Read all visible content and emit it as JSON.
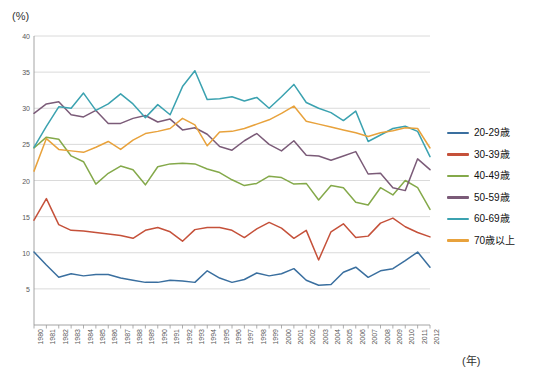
{
  "chart_data": {
    "type": "line",
    "title": "",
    "xlabel": "(年)",
    "ylabel": "(%)",
    "ylim": [
      0,
      40
    ],
    "yticks": [
      5,
      10,
      15,
      20,
      25,
      30,
      35,
      40
    ],
    "grid": true,
    "legend_position": "right",
    "categories": [
      "1980",
      "1981",
      "1982",
      "1983",
      "1984",
      "1985",
      "1986",
      "1987",
      "1988",
      "1989",
      "1990",
      "1991",
      "1992",
      "1993",
      "1994",
      "1995",
      "1996",
      "1997",
      "1998",
      "1999",
      "2000",
      "2001",
      "2002",
      "2003",
      "2004",
      "2005",
      "2006",
      "2007",
      "2008",
      "2009",
      "2010",
      "2011",
      "2012"
    ],
    "series": [
      {
        "name": "20-29歳",
        "color": "#3a6f9f",
        "values": [
          10.1,
          8.3,
          6.6,
          7.1,
          6.8,
          7.0,
          7.0,
          6.5,
          6.2,
          5.9,
          5.9,
          6.2,
          6.1,
          5.9,
          7.5,
          6.5,
          5.9,
          6.3,
          7.2,
          6.8,
          7.1,
          7.8,
          6.2,
          5.5,
          5.6,
          7.3,
          8.0,
          6.6,
          7.5,
          7.8,
          8.9,
          10.1,
          8.0
        ]
      },
      {
        "name": "30-39歳",
        "color": "#c5513a",
        "values": [
          14.5,
          17.5,
          13.9,
          13.1,
          13.0,
          12.8,
          12.6,
          12.4,
          12.0,
          13.1,
          13.5,
          12.9,
          11.6,
          13.2,
          13.5,
          13.5,
          13.1,
          12.1,
          13.3,
          14.2,
          13.4,
          12.0,
          13.1,
          9.0,
          12.9,
          14.0,
          12.1,
          12.3,
          14.1,
          14.8,
          13.6,
          12.8,
          12.2
        ]
      },
      {
        "name": "40-49歳",
        "color": "#84a94a",
        "values": [
          24.5,
          26.0,
          25.7,
          23.4,
          22.6,
          19.5,
          21.0,
          22.0,
          21.5,
          19.4,
          21.9,
          22.3,
          22.4,
          22.3,
          21.6,
          21.1,
          20.1,
          19.3,
          19.6,
          20.6,
          20.4,
          19.5,
          19.6,
          17.3,
          19.3,
          19.0,
          17.0,
          16.6,
          19.0,
          18.0,
          20.0,
          19.0,
          16.0
        ]
      },
      {
        "name": "50-59歳",
        "color": "#7b5b78",
        "values": [
          29.3,
          30.6,
          30.9,
          29.1,
          28.8,
          29.7,
          27.9,
          27.9,
          28.6,
          29.0,
          28.1,
          28.5,
          27.0,
          27.3,
          26.4,
          24.7,
          24.2,
          25.5,
          26.5,
          25.0,
          24.1,
          25.5,
          23.5,
          23.4,
          22.8,
          23.4,
          24.0,
          20.9,
          21.0,
          19.0,
          18.6,
          23.0,
          21.5
        ]
      },
      {
        "name": "60-69歳",
        "color": "#3ba2b0",
        "values": [
          24.6,
          27.5,
          30.2,
          30.0,
          32.1,
          29.7,
          30.6,
          32.0,
          30.6,
          28.7,
          30.5,
          29.1,
          33.0,
          35.2,
          31.2,
          31.3,
          31.6,
          31.0,
          31.5,
          30.0,
          31.6,
          33.3,
          30.8,
          30.0,
          29.4,
          28.3,
          29.6,
          25.4,
          26.3,
          27.2,
          27.5,
          26.8,
          23.3
        ]
      },
      {
        "name": "70歳以上",
        "color": "#e8a23c",
        "values": [
          21.3,
          25.8,
          24.3,
          24.1,
          23.9,
          24.6,
          25.4,
          24.3,
          25.6,
          26.5,
          26.8,
          27.2,
          28.6,
          27.7,
          24.8,
          26.7,
          26.8,
          27.2,
          27.8,
          28.4,
          29.3,
          30.3,
          28.2,
          27.8,
          27.4,
          27.0,
          26.6,
          26.1,
          26.6,
          26.9,
          27.3,
          27.2,
          24.5
        ]
      }
    ]
  },
  "legend": {
    "items": [
      {
        "label": "20-29歳"
      },
      {
        "label": "30-39歳"
      },
      {
        "label": "40-49歳"
      },
      {
        "label": "50-59歳"
      },
      {
        "label": "60-69歳"
      },
      {
        "label": "70歳以上"
      }
    ]
  },
  "labels": {
    "y_unit": "(%)",
    "x_unit": "(年)",
    "clipped_title": ""
  }
}
